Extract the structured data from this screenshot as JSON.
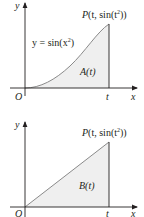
{
  "colors": {
    "axis": "#231f20",
    "curve": "#8a8a8a",
    "fill": "#efefef",
    "text": "#231f20"
  },
  "top_graph": {
    "y_axis_label": "y",
    "x_axis_label": "x",
    "origin_label": "O",
    "t_label": "t",
    "point_label_prefix": "P",
    "point_label": "(t, sin(t",
    "point_label_sup": "2",
    "point_label_suffix": "))",
    "curve_label": "y = sin(x",
    "curve_label_sup": "2",
    "curve_label_suffix": ")",
    "area_label": "A(t)"
  },
  "bottom_graph": {
    "y_axis_label": "y",
    "x_axis_label": "x",
    "origin_label": "O",
    "t_label": "t",
    "point_label_prefix": "P",
    "point_label": "(t, sin(t",
    "point_label_sup": "2",
    "point_label_suffix": "))",
    "area_label": "B(t)"
  }
}
